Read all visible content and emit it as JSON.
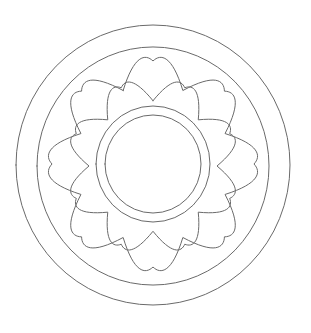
{
  "artwork": {
    "title": "Concentric Mandala Line Drawing",
    "kind": "coloring-page-outline",
    "canvas": {
      "width": 311,
      "height": 333,
      "background": "#ffffff"
    },
    "stroke": {
      "color": "#6a6a6a",
      "width": 1,
      "fill": "none"
    },
    "center": {
      "x": 153,
      "y": 165
    },
    "layers": [
      {
        "id": "outer-ring",
        "name": "outer-circle",
        "shape": "ellipse",
        "cx": 153,
        "cy": 165,
        "rx": 137,
        "ry": 140
      },
      {
        "id": "second-ring",
        "name": "second-circle",
        "shape": "ellipse",
        "cx": 153,
        "cy": 166,
        "rx": 116,
        "ry": 119
      },
      {
        "id": "outer-flower",
        "name": "outer-scalloped-flower",
        "shape": "scallop",
        "cx": 153,
        "cy": 164,
        "petals": 8,
        "outer_radius": 101,
        "inner_radius": 78,
        "rotation_deg": 0,
        "aspect_y": 1.02
      },
      {
        "id": "inner-flower",
        "name": "inner-scalloped-flower",
        "shape": "scallop",
        "cx": 153,
        "cy": 166,
        "petals": 8,
        "outer_radius": 83,
        "inner_radius": 64,
        "rotation_deg": 22.5,
        "aspect_y": 1.02
      },
      {
        "id": "inner-ring-outer",
        "name": "inner-circle-outer",
        "shape": "ellipse",
        "cx": 153,
        "cy": 164,
        "rx": 57,
        "ry": 58
      },
      {
        "id": "inner-ring-inner",
        "name": "inner-circle-inner",
        "shape": "ellipse",
        "cx": 153,
        "cy": 164,
        "rx": 48,
        "ry": 49
      }
    ]
  }
}
